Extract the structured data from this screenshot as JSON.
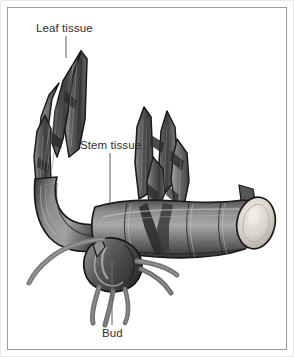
{
  "figure": {
    "domain": "Diagram",
    "background_color": "#ffffff",
    "frame_color": "#9a9a9a",
    "outer_edge_color": "#e9e9e9",
    "label_color": "#2f2f2f",
    "leader_line_color": "#6d6d6d",
    "art_style": "grayscale shaded pen-and-ink"
  },
  "labels": [
    {
      "id": "leaf-tissue",
      "text": "Leaf tissue",
      "x": 36,
      "y": 22,
      "leader": {
        "x1": 66,
        "y1": 36,
        "x2": 66,
        "y2": 58
      }
    },
    {
      "id": "stem-tissue",
      "text": "Stem tissue",
      "x": 80,
      "y": 139,
      "leader": {
        "x1": 110,
        "y1": 153,
        "x2": 110,
        "y2": 200
      }
    },
    {
      "id": "bud",
      "text": "Bud",
      "x": 102,
      "y": 327,
      "leader": {
        "x1": 112,
        "y1": 325,
        "x2": 112,
        "y2": 258
      }
    }
  ],
  "palette": {
    "ink_outline": "#1c1c1c",
    "tissue_dark": "#3a3a3a",
    "tissue_mid": "#6b6b6b",
    "tissue_light": "#9c9c9c",
    "tissue_highlight": "#c7c7c7",
    "cut_face_light": "#e3e0d8",
    "cut_face_shadow": "#b9b5aa",
    "root_tone": "#7d7d7d"
  },
  "structures": [
    {
      "name": "left-leaf-cluster",
      "description": "Upright pointed layered leaf sheaths at upper left"
    },
    {
      "name": "right-leaf-cluster",
      "description": "Upright pointed layered leaf sheaths at upper right"
    },
    {
      "name": "rhizome-elbow",
      "description": "Curved bend of the rhizome at the left"
    },
    {
      "name": "rhizome-body",
      "description": "Horizontal banded stem running to the right"
    },
    {
      "name": "cut-end",
      "description": "Pale elliptical cut face at the right terminus"
    },
    {
      "name": "bud",
      "description": "Rounded bud on the underside of the rhizome"
    },
    {
      "name": "roots",
      "description": "Thin curved root tendrils hanging below and extending left"
    }
  ]
}
